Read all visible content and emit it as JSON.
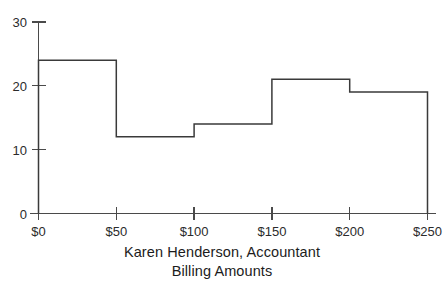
{
  "chart_data": {
    "type": "bar",
    "subtype": "histogram",
    "title": "",
    "caption_line1": "Karen Henderson, Accountant",
    "caption_line2": "Billing Amounts",
    "xlabel": "",
    "ylabel": "",
    "categories": [
      "$0-$50",
      "$50-$100",
      "$100-$150",
      "$150-$200",
      "$200-$250"
    ],
    "bin_edges": [
      0,
      50,
      100,
      150,
      200,
      250
    ],
    "values": [
      24,
      12,
      14,
      21,
      19
    ],
    "bin_width": 50,
    "xlim": [
      0,
      250
    ],
    "ylim": [
      0,
      30
    ],
    "x_tick_labels": [
      "$0",
      "$50",
      "$100",
      "$150",
      "$200",
      "$250"
    ],
    "x_tick_values": [
      0,
      50,
      100,
      150,
      200,
      250
    ],
    "y_tick_labels": [
      "0",
      "10",
      "20",
      "30"
    ],
    "y_tick_values": [
      0,
      10,
      20,
      30
    ],
    "grid": false,
    "legend": false,
    "bar_fill": "none",
    "bar_outline_color": "#3a3a3a",
    "axis_color": "#4a4a4a",
    "background_color": "#ffffff"
  },
  "figure": {
    "name": "histogram-karen-henderson-billing-amounts"
  }
}
